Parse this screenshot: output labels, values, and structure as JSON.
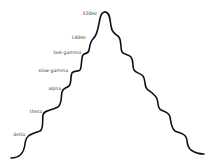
{
  "diagram": {
    "type": "frequency-band staircase",
    "stroke_color": "#111111",
    "background": "#ffffff",
    "labels": [
      {
        "text": "320Hz",
        "x": 97,
        "y": 12
      },
      {
        "text": "140Hz",
        "x": 86,
        "y": 36
      },
      {
        "text": "fast-gamma",
        "x": 81,
        "y": 51
      },
      {
        "text": "slow-gamma",
        "x": 68,
        "y": 69
      },
      {
        "text": "alpha",
        "x": 61,
        "y": 87
      },
      {
        "text": "theta",
        "x": 42,
        "y": 110
      },
      {
        "text": "delta",
        "x": 25,
        "y": 133
      }
    ]
  }
}
